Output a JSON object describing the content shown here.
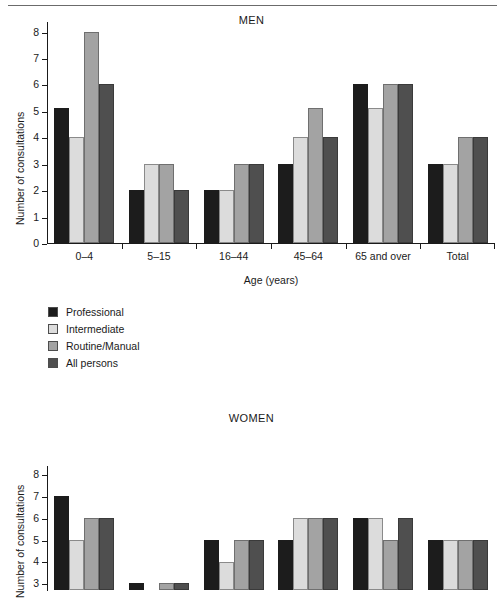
{
  "figure": {
    "y_axis_label": "Number of consultations",
    "x_axis_label": "Age (years)"
  },
  "legend": {
    "items": [
      {
        "label": "Professional",
        "color": "#1c1c1c",
        "key": "professional"
      },
      {
        "label": "Intermediate",
        "color": "#dcdcdc",
        "key": "intermediate"
      },
      {
        "label": "Routine/Manual",
        "color": "#a3a3a3",
        "key": "routine"
      },
      {
        "label": "All persons",
        "color": "#4f4f4f",
        "key": "all"
      }
    ]
  },
  "chart_data": [
    {
      "type": "bar",
      "title": "MEN",
      "xlabel": "Age (years)",
      "ylabel": "Number of consultations",
      "ylim": [
        0,
        8
      ],
      "yticks": [
        0,
        1,
        2,
        3,
        4,
        5,
        6,
        7,
        8
      ],
      "grid": false,
      "legend_position": "below-plot-left",
      "categories": [
        "0–4",
        "5–15",
        "16–44",
        "45–64",
        "65 and over",
        "Total"
      ],
      "series": [
        {
          "name": "Professional",
          "color": "#1c1c1c",
          "values": [
            5.1,
            2,
            2,
            3,
            6,
            3
          ]
        },
        {
          "name": "Intermediate",
          "color": "#dcdcdc",
          "values": [
            4,
            3,
            2,
            4,
            5.1,
            3
          ]
        },
        {
          "name": "Routine/Manual",
          "color": "#a3a3a3",
          "values": [
            8,
            3,
            3,
            5.1,
            6,
            4
          ]
        },
        {
          "name": "All persons",
          "color": "#4f4f4f",
          "values": [
            6,
            2,
            3,
            4,
            6,
            4
          ]
        }
      ]
    },
    {
      "type": "bar",
      "title": "WOMEN",
      "xlabel": "Age (years)",
      "ylabel": "Number of consultations",
      "ylim": [
        0,
        8
      ],
      "yticks": [
        3,
        4,
        5,
        6,
        7,
        8
      ],
      "grid": false,
      "note": "Lower portion of this chart is cropped by the screenshot edge",
      "categories": [
        "0–4",
        "5–15",
        "16–44",
        "45–64",
        "65 and over",
        "Total"
      ],
      "series": [
        {
          "name": "Professional",
          "color": "#1c1c1c",
          "values": [
            7,
            3,
            5,
            5,
            6,
            5
          ]
        },
        {
          "name": "Intermediate",
          "color": "#dcdcdc",
          "values": [
            5,
            0,
            4,
            6,
            6,
            5
          ]
        },
        {
          "name": "Routine/Manual",
          "color": "#a3a3a3",
          "values": [
            6,
            3,
            5,
            6,
            5,
            5
          ]
        },
        {
          "name": "All persons",
          "color": "#4f4f4f",
          "values": [
            6,
            3,
            5,
            6,
            6,
            5
          ]
        }
      ]
    }
  ]
}
